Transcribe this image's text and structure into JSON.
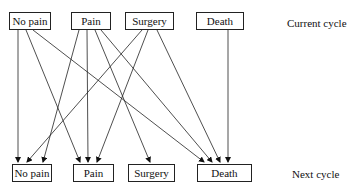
{
  "diagram": {
    "current_cycle_label": "Current cycle",
    "next_cycle_label": "Next cycle",
    "current_states": [
      {
        "id": "no_pain",
        "label": "No pain"
      },
      {
        "id": "pain",
        "label": "Pain"
      },
      {
        "id": "surgery",
        "label": "Surgery"
      },
      {
        "id": "death",
        "label": "Death"
      }
    ],
    "next_states": [
      {
        "id": "no_pain",
        "label": "No pain"
      },
      {
        "id": "pain",
        "label": "Pain"
      },
      {
        "id": "surgery",
        "label": "Surgery"
      },
      {
        "id": "death",
        "label": "Death"
      }
    ],
    "transitions": [
      {
        "from": "No pain",
        "to": "No pain"
      },
      {
        "from": "No pain",
        "to": "Pain"
      },
      {
        "from": "No pain",
        "to": "Death"
      },
      {
        "from": "Pain",
        "to": "No pain"
      },
      {
        "from": "Pain",
        "to": "Pain"
      },
      {
        "from": "Pain",
        "to": "Surgery"
      },
      {
        "from": "Pain",
        "to": "Death"
      },
      {
        "from": "Surgery",
        "to": "No pain"
      },
      {
        "from": "Surgery",
        "to": "Pain"
      },
      {
        "from": "Surgery",
        "to": "Death"
      },
      {
        "from": "Death",
        "to": "Death"
      }
    ]
  }
}
